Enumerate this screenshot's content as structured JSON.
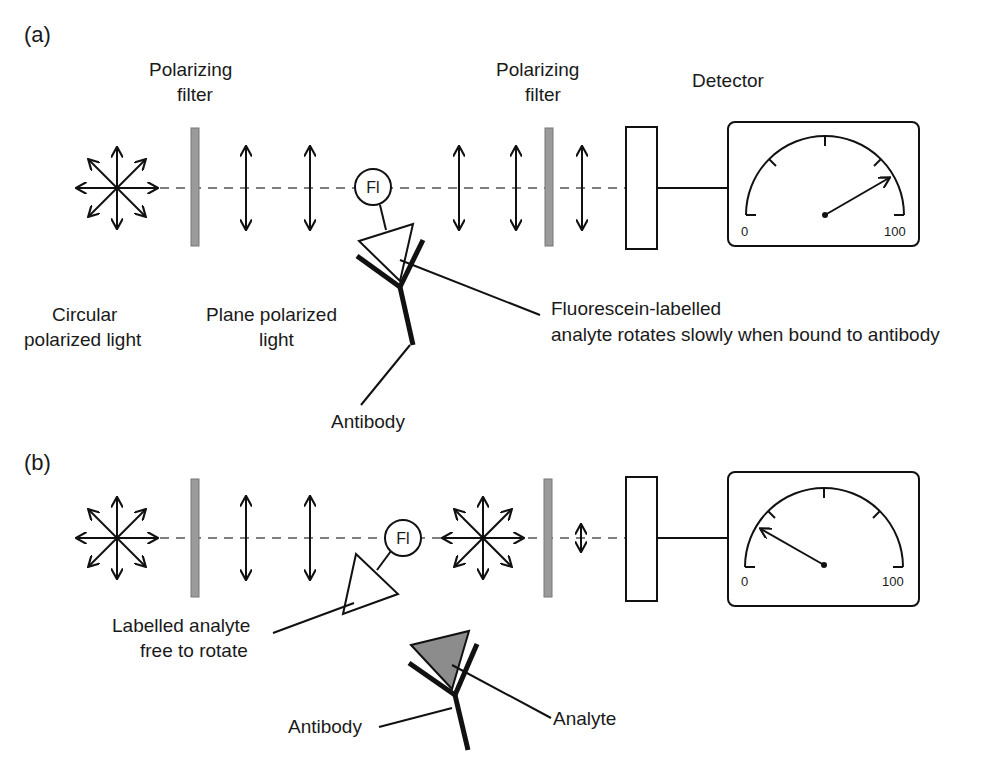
{
  "colors": {
    "line": "#111111",
    "filter": "#9a9a9a",
    "analyte_fill": "#8c8c8c",
    "background": "#ffffff"
  },
  "panel_a": {
    "label": "(a)",
    "filter1_label": [
      "Polarizing",
      "filter"
    ],
    "filter2_label": [
      "Polarizing",
      "filter"
    ],
    "detector_label": "Detector",
    "fluorophore": "Fl",
    "circular_label": [
      "Circular",
      "polarized light"
    ],
    "plane_label": [
      "Plane polarized",
      "light"
    ],
    "callout": [
      "Fluorescein-labelled",
      "analyte rotates slowly when bound to antibody"
    ],
    "antibody_label": "Antibody",
    "gauge": {
      "min": "0",
      "max": "100",
      "reading": "high"
    }
  },
  "panel_b": {
    "label": "(b)",
    "fluorophore": "Fl",
    "free_label": [
      "Labelled analyte",
      "free to rotate"
    ],
    "antibody_label": "Antibody",
    "analyte_label": "Analyte",
    "gauge": {
      "min": "0",
      "max": "100",
      "reading": "low"
    }
  }
}
